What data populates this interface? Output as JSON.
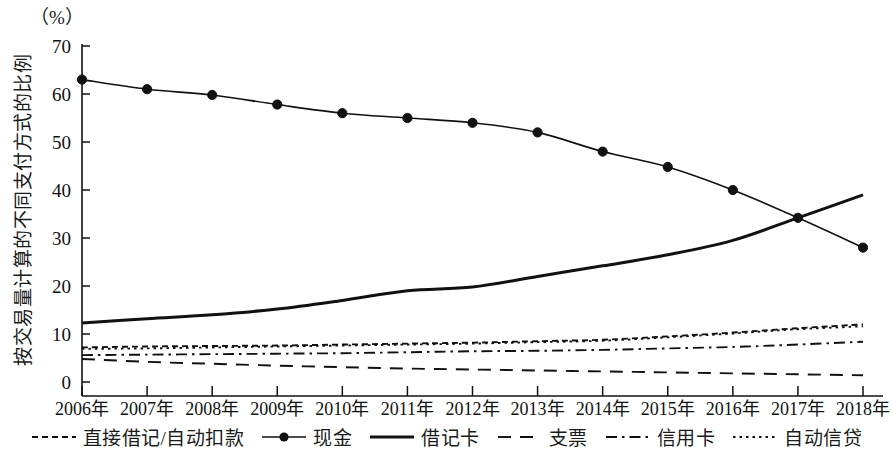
{
  "chart_data": {
    "type": "line",
    "title": "",
    "unit_label": "（%）",
    "ylabel": "按交易量计算的不同支付方式的比例",
    "xlabel": "",
    "grid": false,
    "legend_position": "bottom",
    "ylim": [
      0,
      70
    ],
    "yticks": [
      "0",
      "10",
      "20",
      "30",
      "40",
      "50",
      "60",
      "70"
    ],
    "categories": [
      "2006年",
      "2007年",
      "2008年",
      "2009年",
      "2010年",
      "2011年",
      "2012年",
      "2013年",
      "2014年",
      "2015年",
      "2016年",
      "2017年",
      "2018年"
    ],
    "x": [
      2006,
      2007,
      2008,
      2009,
      2010,
      2011,
      2012,
      2013,
      2014,
      2015,
      2016,
      2017,
      2018
    ],
    "series": [
      {
        "name": "直接借记/自动扣款",
        "style": "short-dashed",
        "marker": "none",
        "color": "#111111",
        "values": [
          7.2,
          7.4,
          7.5,
          7.6,
          7.8,
          8.0,
          8.2,
          8.5,
          8.8,
          9.5,
          10.3,
          11.2,
          12.0
        ]
      },
      {
        "name": "现金",
        "style": "solid-thin",
        "marker": "circle",
        "color": "#111111",
        "values": [
          63.0,
          61.0,
          59.8,
          57.8,
          56.0,
          55.0,
          54.0,
          52.0,
          48.0,
          44.8,
          40.0,
          34.2,
          28.0
        ]
      },
      {
        "name": "借记卡",
        "style": "solid-thick",
        "marker": "none",
        "color": "#111111",
        "values": [
          12.3,
          13.2,
          14.0,
          15.2,
          17.0,
          19.0,
          19.8,
          22.0,
          24.2,
          26.5,
          29.5,
          34.2,
          39.0
        ]
      },
      {
        "name": "支票",
        "style": "long-dashed",
        "marker": "none",
        "color": "#111111",
        "values": [
          4.8,
          4.2,
          3.8,
          3.4,
          3.1,
          2.8,
          2.6,
          2.4,
          2.2,
          2.0,
          1.8,
          1.6,
          1.4
        ]
      },
      {
        "name": "信用卡",
        "style": "dash-dot",
        "marker": "none",
        "color": "#111111",
        "values": [
          5.6,
          5.7,
          5.8,
          5.9,
          6.0,
          6.2,
          6.4,
          6.5,
          6.7,
          7.0,
          7.3,
          7.8,
          8.4
        ]
      },
      {
        "name": "自动信贷",
        "style": "dotted",
        "marker": "none",
        "color": "#111111",
        "values": [
          6.9,
          7.0,
          7.2,
          7.4,
          7.6,
          7.8,
          8.0,
          8.3,
          8.6,
          9.3,
          10.1,
          11.0,
          11.6
        ]
      }
    ]
  },
  "legend": {
    "items": [
      {
        "label": "直接借记/自动扣款",
        "style": "short-dashed",
        "marker": "none"
      },
      {
        "label": "现金",
        "style": "solid-thin",
        "marker": "circle"
      },
      {
        "label": "借记卡",
        "style": "solid-thick",
        "marker": "none"
      },
      {
        "label": "支票",
        "style": "long-dashed",
        "marker": "none"
      },
      {
        "label": "信用卡",
        "style": "dash-dot",
        "marker": "none"
      },
      {
        "label": "自动信贷",
        "style": "dotted",
        "marker": "none"
      }
    ]
  }
}
